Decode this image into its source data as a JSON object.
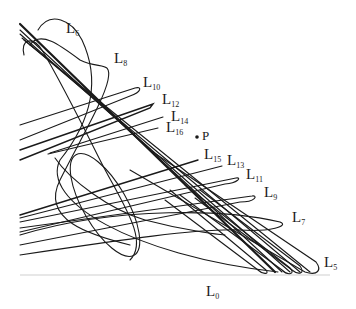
{
  "diagram": {
    "baseline_label": {
      "base": "L",
      "sub": "0"
    },
    "point_label": "P",
    "curve_labels": [
      {
        "id": "L6",
        "base": "L",
        "sub": "6",
        "x": 66,
        "y": 21
      },
      {
        "id": "L8",
        "base": "L",
        "sub": "8",
        "x": 114,
        "y": 51
      },
      {
        "id": "L10",
        "base": "L",
        "sub": "10",
        "x": 143,
        "y": 75
      },
      {
        "id": "L12",
        "base": "L",
        "sub": "12",
        "x": 162,
        "y": 92
      },
      {
        "id": "L14",
        "base": "L",
        "sub": "14",
        "x": 171,
        "y": 109
      },
      {
        "id": "L16",
        "base": "L",
        "sub": "16",
        "x": 166,
        "y": 120
      },
      {
        "id": "L15",
        "base": "L",
        "sub": "15",
        "x": 204,
        "y": 147
      },
      {
        "id": "L13",
        "base": "L",
        "sub": "13",
        "x": 227,
        "y": 153
      },
      {
        "id": "L11",
        "base": "L",
        "sub": "11",
        "x": 246,
        "y": 167
      },
      {
        "id": "L9",
        "base": "L",
        "sub": "9",
        "x": 264,
        "y": 185
      },
      {
        "id": "L7",
        "base": "L",
        "sub": "7",
        "x": 292,
        "y": 210
      },
      {
        "id": "L5",
        "base": "L",
        "sub": "5",
        "x": 324,
        "y": 255
      }
    ],
    "colors": {
      "stroke": "#1a1a1a",
      "baseline": "#cfcfcf",
      "background": "#ffffff"
    }
  }
}
